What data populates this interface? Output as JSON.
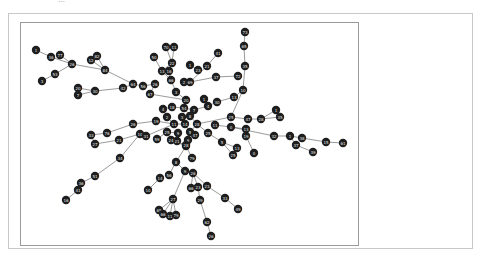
{
  "figure": {
    "title": "…"
  },
  "graph": {
    "node_radius": 4.2,
    "node_color": "#1e1e1e",
    "edge_color": "#555555",
    "nodes": [
      {
        "id": "a1",
        "label": "1",
        "x": 36,
        "y": 50
      },
      {
        "id": "a2",
        "label": "36",
        "x": 51,
        "y": 57
      },
      {
        "id": "a3",
        "label": "77",
        "x": 60,
        "y": 55
      },
      {
        "id": "a4",
        "label": "26",
        "x": 72,
        "y": 64
      },
      {
        "id": "a5",
        "label": "53",
        "x": 55,
        "y": 74
      },
      {
        "id": "a6",
        "label": "3",
        "x": 42,
        "y": 81
      },
      {
        "id": "a7",
        "label": "12",
        "x": 91,
        "y": 60
      },
      {
        "id": "a8",
        "label": "82",
        "x": 97,
        "y": 56
      },
      {
        "id": "a9",
        "label": "84",
        "x": 105,
        "y": 70
      },
      {
        "id": "a10",
        "label": "20",
        "x": 78,
        "y": 88
      },
      {
        "id": "a11",
        "label": "7",
        "x": 78,
        "y": 95
      },
      {
        "id": "a12",
        "label": "30",
        "x": 95,
        "y": 91
      },
      {
        "id": "a13",
        "label": "42",
        "x": 123,
        "y": 88
      },
      {
        "id": "a14",
        "label": "64",
        "x": 133,
        "y": 84
      },
      {
        "id": "a15",
        "label": "56",
        "x": 143,
        "y": 86
      },
      {
        "id": "a16",
        "label": "26",
        "x": 155,
        "y": 84
      },
      {
        "id": "a17",
        "label": "67",
        "x": 150,
        "y": 94
      },
      {
        "id": "a18",
        "label": "50",
        "x": 154,
        "y": 57
      },
      {
        "id": "a19",
        "label": "70",
        "x": 166,
        "y": 47
      },
      {
        "id": "a20",
        "label": "11",
        "x": 174,
        "y": 47
      },
      {
        "id": "a21",
        "label": "22",
        "x": 172,
        "y": 63
      },
      {
        "id": "a22",
        "label": "13",
        "x": 162,
        "y": 71
      },
      {
        "id": "a23",
        "label": "16",
        "x": 169,
        "y": 71
      },
      {
        "id": "a24",
        "label": "66",
        "x": 171,
        "y": 80
      },
      {
        "id": "a25",
        "label": "2",
        "x": 184,
        "y": 82
      },
      {
        "id": "a26",
        "label": "69",
        "x": 190,
        "y": 82
      },
      {
        "id": "a27",
        "label": "1",
        "x": 190,
        "y": 65
      },
      {
        "id": "a28",
        "label": "23",
        "x": 198,
        "y": 70
      },
      {
        "id": "a29",
        "label": "21",
        "x": 207,
        "y": 66
      },
      {
        "id": "a30",
        "label": "41",
        "x": 218,
        "y": 53
      },
      {
        "id": "a31",
        "label": "37",
        "x": 216,
        "y": 77
      },
      {
        "id": "a32",
        "label": "72",
        "x": 238,
        "y": 76
      },
      {
        "id": "a33",
        "label": "73",
        "x": 245,
        "y": 32
      },
      {
        "id": "a34",
        "label": "65",
        "x": 244,
        "y": 46
      },
      {
        "id": "a35",
        "label": "35",
        "x": 245,
        "y": 66
      },
      {
        "id": "a36",
        "label": "10",
        "x": 243,
        "y": 90
      },
      {
        "id": "a37",
        "label": "13",
        "x": 234,
        "y": 97
      },
      {
        "id": "a38",
        "label": "3",
        "x": 176,
        "y": 92
      },
      {
        "id": "a39",
        "label": "20",
        "x": 186,
        "y": 100
      },
      {
        "id": "a40",
        "label": "1",
        "x": 204,
        "y": 99
      },
      {
        "id": "a41",
        "label": "4",
        "x": 208,
        "y": 106
      },
      {
        "id": "a42",
        "label": "30",
        "x": 217,
        "y": 102
      },
      {
        "id": "a43",
        "label": "4",
        "x": 163,
        "y": 109
      },
      {
        "id": "a44",
        "label": "18",
        "x": 172,
        "y": 107
      },
      {
        "id": "a45",
        "label": "54",
        "x": 184,
        "y": 108
      },
      {
        "id": "a46",
        "label": "7",
        "x": 194,
        "y": 110
      },
      {
        "id": "a47",
        "label": "2",
        "x": 167,
        "y": 117
      },
      {
        "id": "a48",
        "label": "3",
        "x": 182,
        "y": 117
      },
      {
        "id": "a49",
        "label": "8",
        "x": 190,
        "y": 116
      },
      {
        "id": "a50",
        "label": "11",
        "x": 174,
        "y": 124
      },
      {
        "id": "a51",
        "label": "14",
        "x": 185,
        "y": 124
      },
      {
        "id": "a52",
        "label": "28",
        "x": 197,
        "y": 124
      },
      {
        "id": "a53",
        "label": "5",
        "x": 190,
        "y": 132
      },
      {
        "id": "a54",
        "label": "9",
        "x": 178,
        "y": 133
      },
      {
        "id": "a55",
        "label": "6",
        "x": 188,
        "y": 140
      },
      {
        "id": "a56",
        "label": "21",
        "x": 177,
        "y": 141
      },
      {
        "id": "a57",
        "label": "18",
        "x": 186,
        "y": 146
      },
      {
        "id": "a58",
        "label": "47",
        "x": 195,
        "y": 135
      },
      {
        "id": "a59",
        "label": "19",
        "x": 156,
        "y": 121
      },
      {
        "id": "a60",
        "label": "26",
        "x": 133,
        "y": 124
      },
      {
        "id": "a61",
        "label": "76",
        "x": 107,
        "y": 133
      },
      {
        "id": "a62",
        "label": "33",
        "x": 91,
        "y": 135
      },
      {
        "id": "a63",
        "label": "27",
        "x": 95,
        "y": 144
      },
      {
        "id": "a64",
        "label": "21",
        "x": 119,
        "y": 140
      },
      {
        "id": "a65",
        "label": "10",
        "x": 140,
        "y": 134
      },
      {
        "id": "a66",
        "label": "31",
        "x": 146,
        "y": 136
      },
      {
        "id": "a67",
        "label": "59",
        "x": 157,
        "y": 139
      },
      {
        "id": "a68",
        "label": "25",
        "x": 167,
        "y": 132
      },
      {
        "id": "a69",
        "label": "24",
        "x": 171,
        "y": 140
      },
      {
        "id": "a70",
        "label": "25",
        "x": 208,
        "y": 133
      },
      {
        "id": "a71",
        "label": "11",
        "x": 215,
        "y": 125
      },
      {
        "id": "a72",
        "label": "0",
        "x": 231,
        "y": 127
      },
      {
        "id": "a73",
        "label": "25",
        "x": 231,
        "y": 117
      },
      {
        "id": "a74",
        "label": "47",
        "x": 248,
        "y": 119
      },
      {
        "id": "a75",
        "label": "13",
        "x": 246,
        "y": 129
      },
      {
        "id": "a76",
        "label": "19",
        "x": 246,
        "y": 136
      },
      {
        "id": "a77",
        "label": "28",
        "x": 261,
        "y": 119
      },
      {
        "id": "a78",
        "label": "1",
        "x": 276,
        "y": 110
      },
      {
        "id": "a79",
        "label": "35",
        "x": 280,
        "y": 117
      },
      {
        "id": "a80",
        "label": "32",
        "x": 274,
        "y": 136
      },
      {
        "id": "a81",
        "label": "1",
        "x": 290,
        "y": 136
      },
      {
        "id": "a82",
        "label": "38",
        "x": 302,
        "y": 138
      },
      {
        "id": "a83",
        "label": "37",
        "x": 296,
        "y": 145
      },
      {
        "id": "a84",
        "label": "39",
        "x": 313,
        "y": 152
      },
      {
        "id": "a85",
        "label": "15",
        "x": 326,
        "y": 142
      },
      {
        "id": "a86",
        "label": "61",
        "x": 343,
        "y": 143
      },
      {
        "id": "a87",
        "label": "0",
        "x": 254,
        "y": 153
      },
      {
        "id": "a88",
        "label": "5",
        "x": 222,
        "y": 142
      },
      {
        "id": "a89",
        "label": "13",
        "x": 237,
        "y": 148
      },
      {
        "id": "a90",
        "label": "25",
        "x": 233,
        "y": 155
      },
      {
        "id": "a91",
        "label": "28",
        "x": 186,
        "y": 145
      },
      {
        "id": "a92",
        "label": "34",
        "x": 120,
        "y": 158
      },
      {
        "id": "a93",
        "label": "51",
        "x": 95,
        "y": 176
      },
      {
        "id": "a94",
        "label": "36",
        "x": 81,
        "y": 183
      },
      {
        "id": "a95",
        "label": "41",
        "x": 78,
        "y": 190
      },
      {
        "id": "a96",
        "label": "16",
        "x": 66,
        "y": 200
      },
      {
        "id": "a97",
        "label": "14",
        "x": 160,
        "y": 178
      },
      {
        "id": "a98",
        "label": "56",
        "x": 169,
        "y": 175
      },
      {
        "id": "a99",
        "label": "10",
        "x": 148,
        "y": 190
      },
      {
        "id": "a100",
        "label": "8",
        "x": 176,
        "y": 162
      },
      {
        "id": "a101",
        "label": "79",
        "x": 192,
        "y": 158
      },
      {
        "id": "a102",
        "label": "9",
        "x": 185,
        "y": 171
      },
      {
        "id": "a103",
        "label": "26",
        "x": 193,
        "y": 173
      },
      {
        "id": "a104",
        "label": "66",
        "x": 191,
        "y": 188
      },
      {
        "id": "a105",
        "label": "23",
        "x": 198,
        "y": 187
      },
      {
        "id": "a106",
        "label": "23",
        "x": 207,
        "y": 186
      },
      {
        "id": "a107",
        "label": "29",
        "x": 200,
        "y": 200
      },
      {
        "id": "a108",
        "label": "33",
        "x": 225,
        "y": 198
      },
      {
        "id": "a109",
        "label": "49",
        "x": 238,
        "y": 209
      },
      {
        "id": "a110",
        "label": "27",
        "x": 173,
        "y": 199
      },
      {
        "id": "a111",
        "label": "65",
        "x": 159,
        "y": 210
      },
      {
        "id": "a112",
        "label": "66",
        "x": 163,
        "y": 214
      },
      {
        "id": "a113",
        "label": "11",
        "x": 170,
        "y": 216
      },
      {
        "id": "a114",
        "label": "79",
        "x": 176,
        "y": 215
      },
      {
        "id": "a115",
        "label": "62",
        "x": 207,
        "y": 222
      },
      {
        "id": "a116",
        "label": "26",
        "x": 211,
        "y": 236
      }
    ],
    "edges": [
      [
        "a1",
        "a2"
      ],
      [
        "a2",
        "a4"
      ],
      [
        "a3",
        "a4"
      ],
      [
        "a4",
        "a5"
      ],
      [
        "a5",
        "a6"
      ],
      [
        "a4",
        "a9"
      ],
      [
        "a7",
        "a9"
      ],
      [
        "a8",
        "a9"
      ],
      [
        "a7",
        "a8"
      ],
      [
        "a9",
        "a14"
      ],
      [
        "a14",
        "a15"
      ],
      [
        "a15",
        "a16"
      ],
      [
        "a10",
        "a12"
      ],
      [
        "a11",
        "a12"
      ],
      [
        "a12",
        "a13"
      ],
      [
        "a13",
        "a14"
      ],
      [
        "a16",
        "a17"
      ],
      [
        "a17",
        "a39"
      ],
      [
        "a18",
        "a22"
      ],
      [
        "a19",
        "a21"
      ],
      [
        "a20",
        "a21"
      ],
      [
        "a21",
        "a22"
      ],
      [
        "a22",
        "a24"
      ],
      [
        "a23",
        "a24"
      ],
      [
        "a24",
        "a38"
      ],
      [
        "a25",
        "a26"
      ],
      [
        "a26",
        "a29"
      ],
      [
        "a27",
        "a28"
      ],
      [
        "a29",
        "a30"
      ],
      [
        "a26",
        "a31"
      ],
      [
        "a31",
        "a32"
      ],
      [
        "a33",
        "a34"
      ],
      [
        "a34",
        "a35"
      ],
      [
        "a35",
        "a36"
      ],
      [
        "a36",
        "a37"
      ],
      [
        "a37",
        "a42"
      ],
      [
        "a38",
        "a39"
      ],
      [
        "a39",
        "a45"
      ],
      [
        "a40",
        "a41"
      ],
      [
        "a41",
        "a46"
      ],
      [
        "a42",
        "a41"
      ],
      [
        "a43",
        "a44"
      ],
      [
        "a44",
        "a45"
      ],
      [
        "a45",
        "a46"
      ],
      [
        "a45",
        "a49"
      ],
      [
        "a47",
        "a50"
      ],
      [
        "a48",
        "a51"
      ],
      [
        "a49",
        "a52"
      ],
      [
        "a50",
        "a51"
      ],
      [
        "a51",
        "a53"
      ],
      [
        "a52",
        "a53"
      ],
      [
        "a53",
        "a55"
      ],
      [
        "a54",
        "a56"
      ],
      [
        "a55",
        "a57"
      ],
      [
        "a56",
        "a57"
      ],
      [
        "a58",
        "a53"
      ],
      [
        "a59",
        "a50"
      ],
      [
        "a60",
        "a59"
      ],
      [
        "a61",
        "a60"
      ],
      [
        "a62",
        "a61"
      ],
      [
        "a63",
        "a64"
      ],
      [
        "a62",
        "a63"
      ],
      [
        "a64",
        "a65"
      ],
      [
        "a65",
        "a66"
      ],
      [
        "a66",
        "a50"
      ],
      [
        "a67",
        "a68"
      ],
      [
        "a68",
        "a54"
      ],
      [
        "a69",
        "a57"
      ],
      [
        "a70",
        "a52"
      ],
      [
        "a71",
        "a72"
      ],
      [
        "a72",
        "a75"
      ],
      [
        "a73",
        "a74"
      ],
      [
        "a74",
        "a77"
      ],
      [
        "a77",
        "a78"
      ],
      [
        "a78",
        "a79"
      ],
      [
        "a77",
        "a79"
      ],
      [
        "a73",
        "a36"
      ],
      [
        "a52",
        "a73"
      ],
      [
        "a72",
        "a80"
      ],
      [
        "a80",
        "a81"
      ],
      [
        "a81",
        "a82"
      ],
      [
        "a81",
        "a83"
      ],
      [
        "a83",
        "a84"
      ],
      [
        "a82",
        "a85"
      ],
      [
        "a85",
        "a86"
      ],
      [
        "a75",
        "a76"
      ],
      [
        "a76",
        "a87"
      ],
      [
        "a70",
        "a88"
      ],
      [
        "a88",
        "a89"
      ],
      [
        "a88",
        "a90"
      ],
      [
        "a89",
        "a90"
      ],
      [
        "a91",
        "a57"
      ],
      [
        "a92",
        "a65"
      ],
      [
        "a92",
        "a93"
      ],
      [
        "a93",
        "a94"
      ],
      [
        "a94",
        "a95"
      ],
      [
        "a95",
        "a96"
      ],
      [
        "a100",
        "a57"
      ],
      [
        "a101",
        "a57"
      ],
      [
        "a100",
        "a98"
      ],
      [
        "a97",
        "a99"
      ],
      [
        "a100",
        "a102"
      ],
      [
        "a102",
        "a103"
      ],
      [
        "a102",
        "a110"
      ],
      [
        "a103",
        "a104"
      ],
      [
        "a103",
        "a105"
      ],
      [
        "a103",
        "a106"
      ],
      [
        "a106",
        "a108"
      ],
      [
        "a108",
        "a109"
      ],
      [
        "a105",
        "a107"
      ],
      [
        "a107",
        "a115"
      ],
      [
        "a115",
        "a116"
      ],
      [
        "a110",
        "a111"
      ],
      [
        "a110",
        "a112"
      ],
      [
        "a110",
        "a113"
      ],
      [
        "a110",
        "a114"
      ],
      [
        "a111",
        "a112"
      ]
    ]
  }
}
